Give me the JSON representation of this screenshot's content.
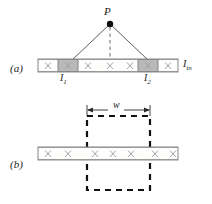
{
  "figure": {
    "type": "physics-schematic",
    "title_visible": false,
    "panels": [
      {
        "id": "a",
        "label": "(a)",
        "label_x": 10,
        "label_y": 64,
        "description": "Detector strip array with two illuminated strips and a point source P above",
        "source": {
          "label": "P",
          "label_x": 105,
          "label_y": 10,
          "dot_x": 110,
          "dot_y": 24,
          "dot_r": 3.2
        },
        "rays": [
          {
            "from_x": 110,
            "from_y": 24,
            "to_x": 72,
            "to_y": 60
          },
          {
            "from_x": 110,
            "from_y": 24,
            "to_x": 148,
            "to_y": 60
          }
        ],
        "center_dashed_line": {
          "x": 110,
          "y1": 26,
          "y2": 60
        },
        "bar": {
          "x": 38,
          "y": 59,
          "width": 140,
          "height": 13,
          "cells": 7,
          "cell_marks": [
            "x",
            "x",
            "x",
            "x",
            "x",
            "x",
            "x"
          ],
          "shaded_indices": [
            1,
            5
          ],
          "shaded_color": "#b9b9b9",
          "unshaded_color": "#fefefd",
          "edge_color": "#7a7a7a"
        },
        "annotations": [
          {
            "text": "I",
            "sub": "1",
            "x": 62,
            "y": 74
          },
          {
            "text": "I",
            "sub": "2",
            "x": 146,
            "y": 74
          },
          {
            "text": "I",
            "sub": "in",
            "x": 184,
            "y": 60
          }
        ]
      },
      {
        "id": "b",
        "label": "(b)",
        "label_x": 10,
        "label_y": 160,
        "description": "Same detector strip array with a dashed box of width w overlaid",
        "dimension": {
          "label": "w",
          "label_x": 115,
          "label_y": 101,
          "line_y": 110,
          "x1": 87,
          "x2": 150
        },
        "dashed_box": {
          "x": 87,
          "y": 116,
          "width": 63,
          "height": 74
        },
        "bar": {
          "x": 38,
          "y": 147,
          "width": 140,
          "height": 13,
          "cells": 7,
          "cell_marks": [
            "x",
            "x",
            "x",
            "x",
            "x",
            "x",
            "x"
          ],
          "shaded_indices": [],
          "unshaded_color": "#fefefd",
          "edge_color": "#7a7a7a"
        }
      }
    ],
    "colors": {
      "line": "#4a4a4a",
      "dashed": "#111111",
      "x_mark": "#9a9a9a",
      "bar_fill": "#fefefd",
      "bar_shaded": "#b9b9b9",
      "bar_stroke": "#7a7a7a",
      "text": "#1a1a1a",
      "background": "#ffffff"
    }
  }
}
